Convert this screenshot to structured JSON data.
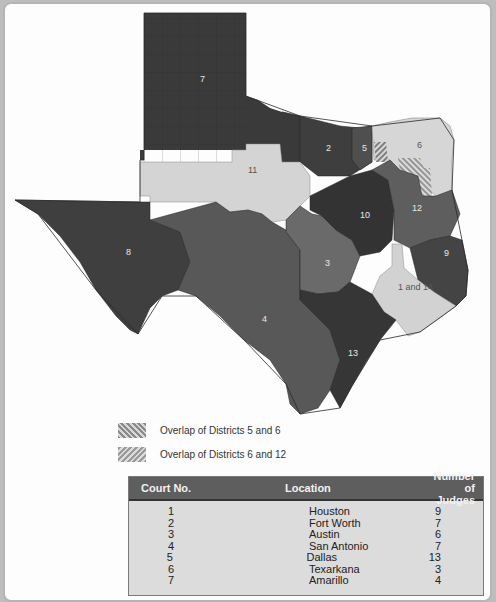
{
  "map": {
    "title": "Texas Courts of Appeals Districts",
    "district_labels": [
      {
        "id": "7",
        "text": "7",
        "x": 200,
        "y": 82
      },
      {
        "id": "2",
        "text": "2",
        "x": 328,
        "y": 150
      },
      {
        "id": "5",
        "text": "5",
        "x": 364,
        "y": 150
      },
      {
        "id": "6",
        "text": "6",
        "x": 419,
        "y": 147
      },
      {
        "id": "11",
        "text": "11",
        "x": 252,
        "y": 172
      },
      {
        "id": "12",
        "text": "12",
        "x": 415,
        "y": 210
      },
      {
        "id": "10",
        "text": "10",
        "x": 364,
        "y": 217
      },
      {
        "id": "8",
        "text": "8",
        "x": 128,
        "y": 254
      },
      {
        "id": "9",
        "text": "9",
        "x": 446,
        "y": 255
      },
      {
        "id": "3",
        "text": "3",
        "x": 327,
        "y": 265
      },
      {
        "id": "1-and-14",
        "text": "1 and 14",
        "x": 412,
        "y": 288
      },
      {
        "id": "4",
        "text": "4",
        "x": 264,
        "y": 321
      },
      {
        "id": "13",
        "text": "13",
        "x": 352,
        "y": 355
      }
    ],
    "colors": {
      "district_dark": "#3c3c3c",
      "district_mid": "#555555",
      "district_mid2": "#666666",
      "district_light": "#d4d4d4",
      "background": "#fdfdfd"
    }
  },
  "legend": {
    "items": [
      {
        "pattern": "hatch-5-6",
        "label": "Overlap of Districts 5 and 6"
      },
      {
        "pattern": "hatch-6-12",
        "label": "Overlap of Districts 6 and 12"
      }
    ]
  },
  "table": {
    "headers": {
      "court_no": "Court No.",
      "location": "Location",
      "judges": "Number of Judges"
    },
    "rows": [
      {
        "court_no": "1",
        "location": "Houston",
        "judges": "9"
      },
      {
        "court_no": "2",
        "location": "Fort Worth",
        "judges": "7"
      },
      {
        "court_no": "3",
        "location": "Austin",
        "judges": "6"
      },
      {
        "court_no": "4",
        "location": "San Antonio",
        "judges": "7"
      },
      {
        "court_no": "5",
        "location": "Dallas",
        "judges": "13"
      },
      {
        "court_no": "6",
        "location": "Texarkana",
        "judges": "3"
      },
      {
        "court_no": "7",
        "location": "Amarillo",
        "judges": "4"
      }
    ]
  }
}
